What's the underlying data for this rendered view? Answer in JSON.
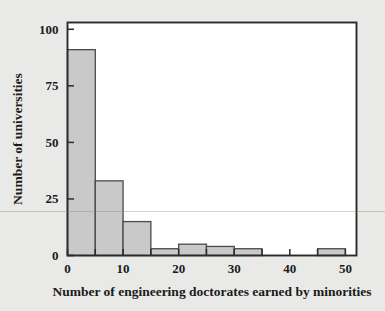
{
  "figure": {
    "background_color": "#e9e9e7",
    "plot_background_color": "#ffffff",
    "frame_color": "#2b2b2b",
    "bar_fill_color": "#c9c9c9",
    "bar_edge_color": "#4a4a4a"
  },
  "chart_data": {
    "type": "bar",
    "title": "",
    "xlabel": "Number of engineering doctorates earned by minorities",
    "ylabel": "Number of universities",
    "xlim": [
      0,
      52
    ],
    "ylim": [
      0,
      103
    ],
    "grid": false,
    "legend": null,
    "bin_width": 5,
    "bin_edges": [
      0,
      5,
      10,
      15,
      20,
      25,
      30,
      35,
      40,
      45,
      50
    ],
    "categories": [
      "0-5",
      "5-10",
      "10-15",
      "15-20",
      "20-25",
      "25-30",
      "30-35",
      "35-40",
      "40-45",
      "45-50"
    ],
    "values": [
      91,
      33,
      15,
      3,
      5,
      4,
      3,
      0,
      0,
      3
    ],
    "x_ticks": [
      0,
      5,
      10,
      15,
      20,
      25,
      30,
      35,
      40,
      45,
      50
    ],
    "x_tick_labels": [
      "0",
      "",
      "10",
      "",
      "20",
      "",
      "30",
      "",
      "40",
      "",
      "50"
    ],
    "y_ticks": [
      0,
      25,
      50,
      75,
      100
    ],
    "y_tick_labels": [
      "0",
      "25",
      "50",
      "75",
      "100"
    ],
    "tick_direction": "in"
  },
  "axis": {
    "x_label": "Number of engineering doctorates earned by minorities",
    "y_label": "Number of universities"
  }
}
